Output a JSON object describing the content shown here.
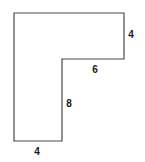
{
  "figure": {
    "kind": "geometry-diagram",
    "background_color": "#ffffff",
    "stroke_color": "#4a4a4a",
    "stroke_width": 1.2,
    "fill_color": "#ffffff",
    "label_color": "#1a1a1a",
    "canvas": {
      "width": 145,
      "height": 162
    },
    "vertices": [
      {
        "name": "top-left",
        "x": 14,
        "y": 13
      },
      {
        "name": "top-right",
        "x": 124,
        "y": 13
      },
      {
        "name": "right-bottom",
        "x": 124,
        "y": 59
      },
      {
        "name": "inner-corner",
        "x": 62,
        "y": 59
      },
      {
        "name": "lower-leg-bottom-right",
        "x": 62,
        "y": 141
      },
      {
        "name": "bottom-left",
        "x": 14,
        "y": 141
      }
    ],
    "labels": [
      {
        "id": "right-side",
        "text": "4",
        "x": 131,
        "y": 35,
        "edge": "right-vertical-edge"
      },
      {
        "id": "inner-top",
        "text": "6",
        "x": 95,
        "y": 70,
        "edge": "inner-horizontal-edge"
      },
      {
        "id": "inner-side",
        "text": "8",
        "x": 69,
        "y": 104,
        "edge": "inner-vertical-edge"
      },
      {
        "id": "bottom-side",
        "text": "4",
        "x": 37,
        "y": 152,
        "edge": "bottom-horizontal-edge"
      }
    ]
  }
}
